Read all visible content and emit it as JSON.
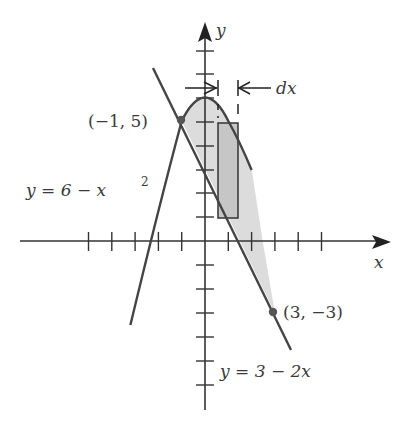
{
  "figure": {
    "colors": {
      "line": "#333333",
      "region_fill": "#d9d9d9",
      "rect_fill": "#c8c8c8",
      "text": "#3a3a3a"
    },
    "axes": {
      "x_label": "x",
      "y_label": "y",
      "origin_px": [
        205,
        241
      ],
      "x_unit_px": 23.3,
      "y_unit_px": 24,
      "x_ticks": [
        -5,
        -4,
        -3,
        -2,
        -1,
        1,
        2,
        3,
        4,
        5
      ],
      "y_ticks": [
        -6,
        -5,
        -4,
        -3,
        -2,
        -1,
        1,
        2,
        3,
        4,
        5,
        6,
        7,
        8
      ]
    },
    "curves": [
      {
        "name": "parabola",
        "label": "y = 6 − x²",
        "equation": "y = 6 - x^2"
      },
      {
        "name": "line",
        "label": "y = 3 − 2x",
        "equation": "y = 3 - 2x"
      }
    ],
    "points": [
      {
        "label": "(−1, 5)",
        "x": -1,
        "y": 5
      },
      {
        "label": "(3, −3)",
        "x": 3,
        "y": -3
      }
    ],
    "strip": {
      "label": "dx"
    },
    "labels": {
      "parabola_eq": "y = 6 − x",
      "parabola_exp": "2",
      "line_eq": "y = 3 − 2x",
      "point_a": "(−1, 5)",
      "point_b": "(3, −3)",
      "dx": "dx",
      "x_axis": "x",
      "y_axis": "y"
    }
  }
}
